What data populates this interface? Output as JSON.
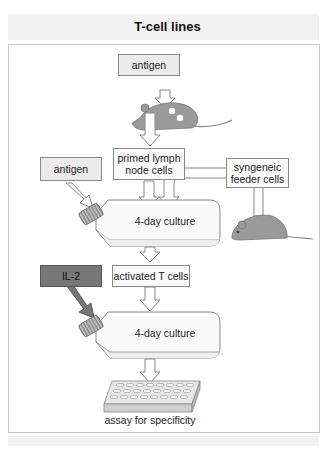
{
  "title": "T-cell lines",
  "nodes": {
    "antigen_top": "antigen",
    "primed": "primed lymph node cells",
    "primed_line1": "primed lymph",
    "primed_line2": "node cells",
    "antigen_left": "antigen",
    "syngeneic_line1": "syngeneic",
    "syngeneic_line2": "feeder cells",
    "culture1": "4-day culture",
    "activated": "activated T cells",
    "il2": "IL-2",
    "culture2": "4-day culture",
    "assay": "assay for specificity"
  },
  "colors": {
    "box_fill": "#ebebeb",
    "il2_fill": "#777777",
    "mouse": "#9a9a9a",
    "arrow_outline": "#888888"
  }
}
